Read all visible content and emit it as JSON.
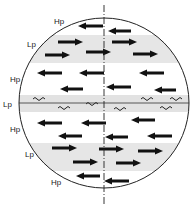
{
  "diagram": {
    "type": "atmospheric-circulation-bands",
    "circle": {
      "cx": 104,
      "cy": 103,
      "r": 85
    },
    "axis": {
      "x": 104,
      "y1": 5,
      "y2": 205,
      "style": "dash-dot"
    },
    "equator_line": {
      "y": 103
    },
    "labels": [
      {
        "text": "Hp",
        "x": 54,
        "y": 23
      },
      {
        "text": "Lp",
        "x": 27,
        "y": 46
      },
      {
        "text": "Hp",
        "x": 10,
        "y": 81
      },
      {
        "text": "Lp",
        "x": 3,
        "y": 106
      },
      {
        "text": "Hp",
        "x": 10,
        "y": 131
      },
      {
        "text": "Lp",
        "x": 25,
        "y": 156
      },
      {
        "text": "Hp",
        "x": 51,
        "y": 184
      }
    ],
    "bands": [
      {
        "name": "Lp-north",
        "y1": 35,
        "y2": 63,
        "shade": "#e6e6e6"
      },
      {
        "name": "Lp-equator",
        "y1": 95,
        "y2": 112,
        "shade": "#e2e2e2"
      },
      {
        "name": "Lp-south",
        "y1": 143,
        "y2": 171,
        "shade": "#e6e6e6"
      }
    ],
    "arrows": [
      {
        "x1": 103,
        "y": 26,
        "dir": "left",
        "len": 25
      },
      {
        "x1": 131,
        "y": 31,
        "dir": "left",
        "len": 23
      },
      {
        "x1": 58,
        "y": 42,
        "dir": "right",
        "len": 25
      },
      {
        "x1": 112,
        "y": 42,
        "dir": "right",
        "len": 25
      },
      {
        "x1": 45,
        "y": 55,
        "dir": "right",
        "len": 25
      },
      {
        "x1": 86,
        "y": 52,
        "dir": "right",
        "len": 25
      },
      {
        "x1": 133,
        "y": 54,
        "dir": "right",
        "len": 25
      },
      {
        "x1": 62,
        "y": 73,
        "dir": "left",
        "len": 25
      },
      {
        "x1": 104,
        "y": 73,
        "dir": "left",
        "len": 25
      },
      {
        "x1": 164,
        "y": 73,
        "dir": "left",
        "len": 25
      },
      {
        "x1": 83,
        "y": 89,
        "dir": "left",
        "len": 23
      },
      {
        "x1": 131,
        "y": 87,
        "dir": "left",
        "len": 25
      },
      {
        "x1": 176,
        "y": 90,
        "dir": "left",
        "len": 22
      },
      {
        "x1": 62,
        "y": 123,
        "dir": "left",
        "len": 25
      },
      {
        "x1": 106,
        "y": 123,
        "dir": "left",
        "len": 25
      },
      {
        "x1": 155,
        "y": 120,
        "dir": "left",
        "len": 24
      },
      {
        "x1": 82,
        "y": 136,
        "dir": "left",
        "len": 24
      },
      {
        "x1": 128,
        "y": 137,
        "dir": "left",
        "len": 23
      },
      {
        "x1": 172,
        "y": 136,
        "dir": "left",
        "len": 25
      },
      {
        "x1": 52,
        "y": 148,
        "dir": "right",
        "len": 25
      },
      {
        "x1": 99,
        "y": 149,
        "dir": "right",
        "len": 25
      },
      {
        "x1": 138,
        "y": 151,
        "dir": "right",
        "len": 25
      },
      {
        "x1": 73,
        "y": 162,
        "dir": "right",
        "len": 25
      },
      {
        "x1": 116,
        "y": 163,
        "dir": "right",
        "len": 25
      },
      {
        "x1": 100,
        "y": 176,
        "dir": "left",
        "len": 24
      },
      {
        "x1": 129,
        "y": 181,
        "dir": "left",
        "len": 25
      }
    ],
    "waves": [
      {
        "x": 33,
        "y": 98
      },
      {
        "x": 86,
        "y": 103
      },
      {
        "x": 141,
        "y": 98
      },
      {
        "x": 170,
        "y": 98
      },
      {
        "x": 58,
        "y": 107
      },
      {
        "x": 114,
        "y": 108
      },
      {
        "x": 160,
        "y": 107
      }
    ]
  }
}
